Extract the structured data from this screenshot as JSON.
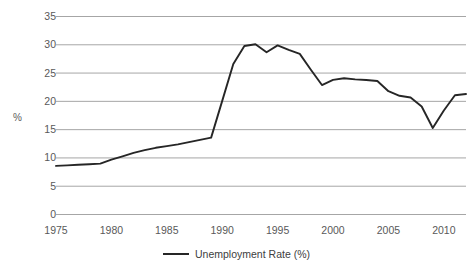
{
  "chart_data": {
    "type": "line",
    "title": "",
    "xlabel": "",
    "ylabel": "%",
    "xlim": [
      1975,
      2012
    ],
    "ylim": [
      0,
      35
    ],
    "grid": true,
    "legend_position": "bottom",
    "xticks": [
      "1975",
      "1980",
      "1985",
      "1990",
      "1995",
      "2000",
      "2005",
      "2010"
    ],
    "xtick_values": [
      1975,
      1980,
      1985,
      1990,
      1995,
      2000,
      2005,
      2010
    ],
    "yticks": [
      "0",
      "5",
      "10",
      "15",
      "20",
      "25",
      "30",
      "35"
    ],
    "ytick_values": [
      0,
      5,
      10,
      15,
      20,
      25,
      30,
      35
    ],
    "series": [
      {
        "name": "Unemployment Rate (%)",
        "color": "#262626",
        "x": [
          1975,
          1976,
          1977,
          1978,
          1979,
          1980,
          1981,
          1982,
          1983,
          1984,
          1985,
          1986,
          1987,
          1988,
          1989,
          1990,
          1991,
          1992,
          1993,
          1994,
          1995,
          1996,
          1997,
          1998,
          1999,
          2000,
          2001,
          2002,
          2003,
          2004,
          2005,
          2006,
          2007,
          2008,
          2009,
          2010,
          2011,
          2012
        ],
        "values": [
          8.5,
          8.6,
          8.7,
          8.8,
          8.9,
          9.6,
          10.2,
          10.8,
          11.3,
          11.7,
          12.0,
          12.3,
          12.7,
          13.1,
          13.5,
          20.0,
          26.5,
          29.7,
          30.0,
          28.6,
          29.8,
          29.0,
          28.3,
          25.5,
          22.8,
          23.7,
          24.0,
          23.8,
          23.7,
          23.5,
          21.7,
          20.9,
          20.6,
          19.0,
          15.2,
          18.3,
          21.0,
          21.2
        ]
      }
    ],
    "legend": [
      {
        "label": "Unemployment Rate (%)",
        "color": "#262626"
      }
    ]
  },
  "style": {
    "grid_color": "#a6a6a6",
    "axis_color": "#a6a6a6",
    "tick_text_color": "#595959",
    "line_color": "#262626",
    "background": "#ffffff"
  }
}
